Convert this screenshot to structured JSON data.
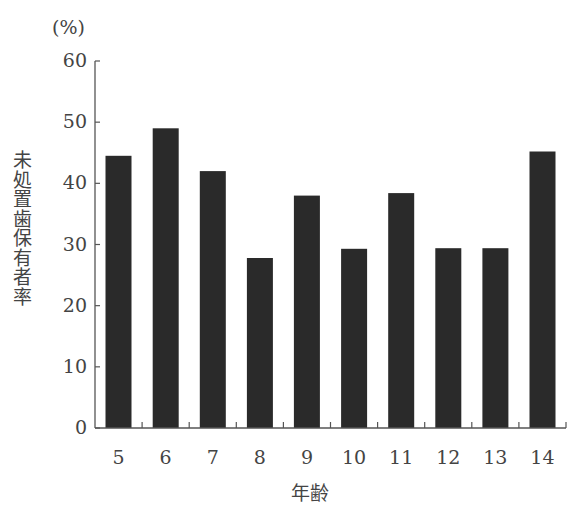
{
  "chart_data": {
    "type": "bar",
    "title": "",
    "unit_label": "(%)",
    "ylabel": "未処置歯保有者率",
    "xlabel": "年齢",
    "categories": [
      "5",
      "6",
      "7",
      "8",
      "9",
      "10",
      "11",
      "12",
      "13",
      "14"
    ],
    "values": [
      44.5,
      49.0,
      42.0,
      27.8,
      38.0,
      29.3,
      38.4,
      29.4,
      29.4,
      45.2
    ],
    "ylim": [
      0,
      60
    ],
    "yticks": [
      0,
      10,
      20,
      30,
      40,
      50,
      60
    ],
    "grid": false,
    "legend": null,
    "bar_color": "#2a2a2a"
  }
}
